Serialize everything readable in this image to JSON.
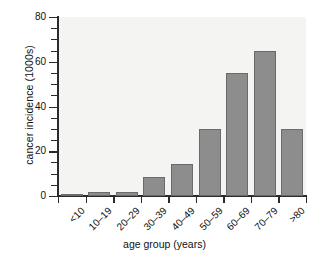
{
  "chart_data": {
    "type": "bar",
    "title": "",
    "xlabel": "age group (years)",
    "ylabel": "cancer incidence (1000s)",
    "categories": [
      "<10",
      "10–19",
      "20–29",
      "30–39",
      "40–49",
      "50–59",
      "60–69",
      "70–79",
      ">80"
    ],
    "values": [
      1,
      2,
      2,
      8.5,
      14.5,
      30,
      55,
      65,
      30
    ],
    "ylim": [
      0,
      80
    ],
    "yticks_major": [
      0,
      20,
      40,
      60,
      80
    ],
    "yticks_minor": [
      5,
      10,
      15,
      25,
      30,
      35,
      45,
      50,
      55,
      65,
      70,
      75
    ],
    "ytick_labels": [
      "0",
      "20",
      "40",
      "60",
      "80"
    ],
    "grid": false,
    "legend": "none",
    "bar_color": "#8d8d8d",
    "bar_edge_color": "#6a6a6a",
    "plot_background": "#f4f4f2",
    "axis_color": "#2b2b2b"
  },
  "caption": {
    "text": ""
  }
}
